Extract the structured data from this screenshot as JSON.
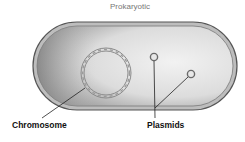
{
  "diagram": {
    "title": "Prokaryotic",
    "labels": {
      "chromosome": "Chromosome",
      "plasmids": "Plasmids"
    },
    "colors": {
      "membrane": "#6a6a6a",
      "cytoplasm_dark": "#9a9a9a",
      "cytoplasm_light": "#ededed",
      "chromosome": "#8a8a8a",
      "label_text": "#111111",
      "title_text": "#777777"
    }
  }
}
